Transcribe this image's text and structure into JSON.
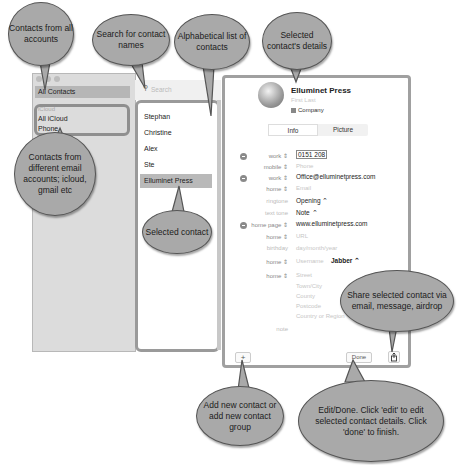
{
  "sidebar": {
    "all_contacts": "All Contacts",
    "group_header": "iCloud",
    "items": [
      "All iCloud",
      "Phone"
    ]
  },
  "list": {
    "search_placeholder": "Search",
    "contacts": [
      "Stephan",
      "Christine",
      "Alex",
      "Ste",
      "Elluminet Press"
    ],
    "selected": "Elluminet Press"
  },
  "detail": {
    "name": "Elluminet Press",
    "name_placeholder": "First Last",
    "company_label": "Company",
    "tabs": [
      "Info",
      "Picture"
    ],
    "rows": [
      {
        "label": "work",
        "value": "0151 208",
        "placeholder": false,
        "minus": true,
        "stepper": true
      },
      {
        "label": "mobile",
        "value": "Phone",
        "placeholder": true,
        "minus": false,
        "stepper": true
      },
      {
        "label": "work",
        "value": "Office@elluminetpress.com",
        "placeholder": false,
        "minus": true,
        "stepper": true
      },
      {
        "label": "home",
        "value": "Email",
        "placeholder": true,
        "minus": false,
        "stepper": true
      },
      {
        "label": "ringtone",
        "value": "Opening ⌃",
        "placeholder": false,
        "minus": false,
        "stepper": false
      },
      {
        "label": "text tone",
        "value": "Note ⌃",
        "placeholder": false,
        "minus": false,
        "stepper": false
      },
      {
        "label": "home page",
        "value": "www.elluminetpress.com",
        "placeholder": false,
        "minus": true,
        "stepper": true
      },
      {
        "label": "home",
        "value": "URL",
        "placeholder": true,
        "minus": false,
        "stepper": true
      },
      {
        "label": "birthday",
        "value": "day/month/year",
        "placeholder": true,
        "minus": false,
        "stepper": false
      },
      {
        "label": "home",
        "value": "Username",
        "extra": "Jabber ⌃",
        "placeholder": true,
        "minus": false,
        "stepper": true
      },
      {
        "label": "home",
        "value": "Street",
        "placeholder": true,
        "minus": false,
        "stepper": true
      }
    ],
    "address_lines": [
      "Town/City",
      "County",
      "Postcode",
      "Country or Region"
    ],
    "note_label": "note",
    "add_button": "+",
    "done_button": "Done",
    "share_icon": "share-icon"
  },
  "callouts": {
    "all_accounts": "Contacts from all accounts",
    "search": "Search for contact names",
    "alphabetical": "Alphabetical list of contacts",
    "selected_details": "Selected contact's details",
    "different_accounts": "Contacts from different email accounts; icloud, gmail etc",
    "selected_contact": "Selected contact",
    "share": "Share selected contact via email, message, airdrop",
    "add": "Add new contact or add new contact group",
    "edit_done": "Edit/Done. Click 'edit' to edit selected contact details. Click 'done' to finish."
  }
}
